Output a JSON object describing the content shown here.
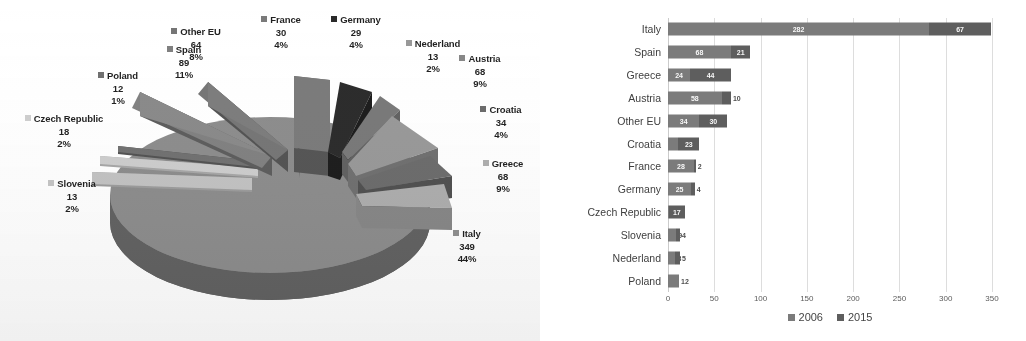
{
  "chart_data": [
    {
      "type": "pie",
      "title": "",
      "subtitle": "",
      "xlabel": "",
      "ylabel": "",
      "legend_position": "labels-outside",
      "grid": false,
      "note": "3D exploded pie with data labels showing category name, value and percent of total",
      "total": 787,
      "categories": [
        "France",
        "Germany",
        "Nederland",
        "Austria",
        "Croatia",
        "Greece",
        "Italy",
        "Slovenia",
        "Czech Republic",
        "Poland",
        "Spain",
        "Other EU"
      ],
      "values": [
        30,
        29,
        13,
        68,
        34,
        68,
        349,
        13,
        18,
        12,
        89,
        64
      ],
      "percents": [
        "4%",
        "4%",
        "2%",
        "9%",
        "4%",
        "9%",
        "44%",
        "2%",
        "2%",
        "1%",
        "11%",
        "8%"
      ],
      "slices": [
        {
          "label": "France",
          "value": 30,
          "percent": "4%",
          "color": "#7a7a7a"
        },
        {
          "label": "Germany",
          "value": 29,
          "percent": "4%",
          "color": "#2b2b2b"
        },
        {
          "label": "Nederland",
          "value": 13,
          "percent": "2%",
          "color": "#9a9a9a"
        },
        {
          "label": "Austria",
          "value": 68,
          "percent": "9%",
          "color": "#888888"
        },
        {
          "label": "Croatia",
          "value": 34,
          "percent": "4%",
          "color": "#6a6a6a"
        },
        {
          "label": "Greece",
          "value": 68,
          "percent": "9%",
          "color": "#b0b0b0"
        },
        {
          "label": "Italy",
          "value": 349,
          "percent": "44%",
          "color": "#8d8d8d"
        },
        {
          "label": "Slovenia",
          "value": 13,
          "percent": "2%",
          "color": "#c6c6c6"
        },
        {
          "label": "Czech Republic",
          "value": 18,
          "percent": "2%",
          "color": "#d2d2d2"
        },
        {
          "label": "Poland",
          "value": 12,
          "percent": "1%",
          "color": "#6f6f6f"
        },
        {
          "label": "Spain",
          "value": 89,
          "percent": "11%",
          "color": "#808080"
        },
        {
          "label": "Other EU",
          "value": 64,
          "percent": "8%",
          "color": "#747474"
        }
      ]
    },
    {
      "type": "bar",
      "orientation": "horizontal",
      "stacked": true,
      "title": "",
      "xlabel": "",
      "ylabel": "",
      "grid": true,
      "legend_position": "bottom",
      "xlim": [
        0,
        350
      ],
      "xticks": [
        "0",
        "50",
        "100",
        "150",
        "200",
        "250",
        "300",
        "350"
      ],
      "categories": [
        "Italy",
        "Spain",
        "Greece",
        "Austria",
        "Other EU",
        "Croatia",
        "France",
        "Germany",
        "Czech Republic",
        "Slovenia",
        "Nederland",
        "Poland"
      ],
      "series": [
        {
          "name": "2006",
          "color": "#7b7b7b",
          "values": [
            282,
            68,
            24,
            58,
            34,
            11,
            28,
            25,
            1,
            9,
            8,
            12
          ]
        },
        {
          "name": "2015",
          "color": "#5c5c5c",
          "values": [
            67,
            21,
            44,
            10,
            30,
            23,
            2,
            4,
            17,
            4,
            5,
            0
          ]
        }
      ]
    }
  ],
  "pie": {
    "labels": [
      {
        "name": "Other EU",
        "value": "64",
        "percent": "8%"
      },
      {
        "name": "France",
        "value": "30",
        "percent": "4%"
      },
      {
        "name": "Germany",
        "value": "29",
        "percent": "4%"
      },
      {
        "name": "Nederland",
        "value": "13",
        "percent": "2%"
      },
      {
        "name": "Austria",
        "value": "68",
        "percent": "9%"
      },
      {
        "name": "Croatia",
        "value": "34",
        "percent": "4%"
      },
      {
        "name": "Greece",
        "value": "68",
        "percent": "9%"
      },
      {
        "name": "Italy",
        "value": "349",
        "percent": "44%"
      },
      {
        "name": "Slovenia",
        "value": "13",
        "percent": "2%"
      },
      {
        "name": "Czech Republic",
        "value": "18",
        "percent": "2%"
      },
      {
        "name": "Poland",
        "value": "12",
        "percent": "1%"
      },
      {
        "name": "Spain",
        "value": "89",
        "percent": "11%"
      }
    ]
  },
  "bar": {
    "categories": [
      "Italy",
      "Spain",
      "Greece",
      "Austria",
      "Other EU",
      "Croatia",
      "France",
      "Germany",
      "Czech Republic",
      "Slovenia",
      "Nederland",
      "Poland"
    ],
    "rows": [
      {
        "category": "Italy",
        "v2006": "282",
        "v2015": "67"
      },
      {
        "category": "Spain",
        "v2006": "68",
        "v2015": "21"
      },
      {
        "category": "Greece",
        "v2006": "24",
        "v2015": "44"
      },
      {
        "category": "Austria",
        "v2006": "58",
        "v2015": "10"
      },
      {
        "category": "Other EU",
        "v2006": "34",
        "v2015": "30"
      },
      {
        "category": "Croatia",
        "v2006": "11",
        "v2015": "23"
      },
      {
        "category": "France",
        "v2006": "28",
        "v2015": "2"
      },
      {
        "category": "Germany",
        "v2006": "25",
        "v2015": "4"
      },
      {
        "category": "Czech Republic",
        "v2006": "1",
        "v2015": "17"
      },
      {
        "category": "Slovenia",
        "v2006": "9",
        "v2015": "4"
      },
      {
        "category": "Nederland",
        "v2006": "8",
        "v2015": "5"
      },
      {
        "category": "Poland",
        "v2006": "12",
        "v2015": ""
      }
    ],
    "xticks": [
      "0",
      "50",
      "100",
      "150",
      "200",
      "250",
      "300",
      "350"
    ],
    "legend": [
      {
        "label": "2006",
        "color": "#7b7b7b"
      },
      {
        "label": "2015",
        "color": "#5c5c5c"
      }
    ]
  }
}
